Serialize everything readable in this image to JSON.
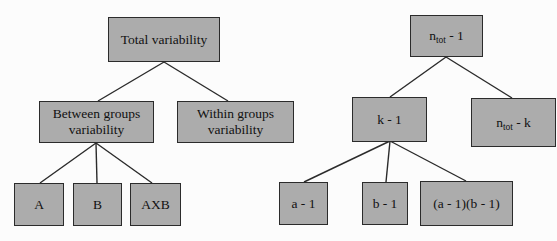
{
  "diagram": {
    "colors": {
      "background": "#fcfcfc",
      "box_fill": "#acacac",
      "box_border": "#2b2b2b",
      "line": "#2b2b2b",
      "text": "#111111"
    },
    "left_tree": {
      "root": {
        "label": "Total variability"
      },
      "children": [
        {
          "label": "Between groups variability"
        },
        {
          "label": "Within groups variability"
        }
      ],
      "leaves": [
        {
          "label": "A"
        },
        {
          "label": "B"
        },
        {
          "label": "AXB"
        }
      ]
    },
    "right_tree": {
      "root": {
        "pre": "n",
        "sub": "tot",
        "post": " - 1"
      },
      "children": [
        {
          "label": "k - 1"
        },
        {
          "pre": "n",
          "sub": "tot",
          "post": " - k"
        }
      ],
      "leaves": [
        {
          "label": "a - 1"
        },
        {
          "label": "b - 1"
        },
        {
          "label": "(a - 1)(b - 1)"
        }
      ]
    }
  }
}
